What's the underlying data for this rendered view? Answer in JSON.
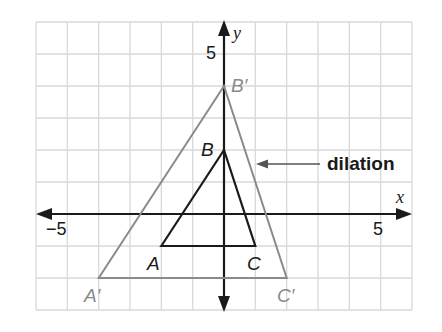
{
  "diagram": {
    "type": "coordinate-plane-dilation",
    "axes": {
      "x_label": "x",
      "y_label": "y",
      "x_tick_neg": "−5",
      "x_tick_pos": "5",
      "y_tick_pos": "5",
      "x_range": [
        -6,
        6
      ],
      "y_range": [
        -3,
        6
      ]
    },
    "original_triangle": {
      "color": "#1a1a1a",
      "vertices": [
        {
          "name": "A",
          "x": -2,
          "y": -1
        },
        {
          "name": "B",
          "x": 0,
          "y": 2
        },
        {
          "name": "C",
          "x": 1,
          "y": -1
        }
      ]
    },
    "image_triangle": {
      "color": "#8a8a8a",
      "vertices": [
        {
          "name": "A′",
          "x": -4,
          "y": -2
        },
        {
          "name": "B′",
          "x": 0,
          "y": 4
        },
        {
          "name": "C′",
          "x": 2,
          "y": -2
        }
      ]
    },
    "callout": {
      "label": "dilation"
    },
    "colors": {
      "grid": "#d9d9d9",
      "axes": "#1a1a1a",
      "image": "#8a8a8a",
      "original": "#1a1a1a"
    }
  }
}
